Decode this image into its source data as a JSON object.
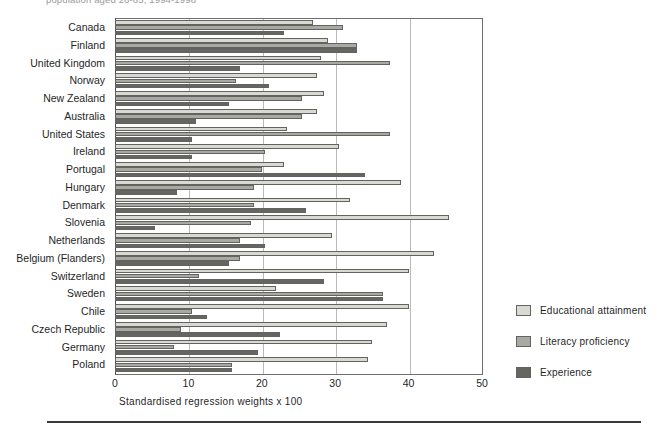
{
  "figure": {
    "title": "population aged 26-65, 1994-1998",
    "bottom_rule": true
  },
  "legend": {
    "position": "right",
    "items": [
      {
        "label": "Educational attainment",
        "color": "#d9d9d4"
      },
      {
        "label": "Literacy proficiency",
        "color": "#a9a9a4"
      },
      {
        "label": "Experience",
        "color": "#656561"
      }
    ]
  },
  "axis": {
    "xlabel": "Standardised regression weights x 100",
    "ticks": [
      "0",
      "10",
      "20",
      "30",
      "40",
      "50"
    ],
    "min": 0,
    "max": 50
  },
  "chart_data": {
    "type": "bar",
    "orientation": "horizontal",
    "title": "population aged 26-65, 1994-1998",
    "xlabel": "Standardised regression weights x 100",
    "ylabel": "",
    "xlim": [
      0,
      50
    ],
    "grid": true,
    "legend_position": "right",
    "categories": [
      "Canada",
      "Finland",
      "United Kingdom",
      "Norway",
      "New Zealand",
      "Australia",
      "United States",
      "Ireland",
      "Portugal",
      "Hungary",
      "Denmark",
      "Slovenia",
      "Netherlands",
      "Belgium (Flanders)",
      "Switzerland",
      "Sweden",
      "Chile",
      "Czech Republic",
      "Germany",
      "Poland"
    ],
    "series": [
      {
        "name": "Educational attainment",
        "color": "#d9d9d4",
        "values": [
          27.0,
          29.0,
          28.0,
          27.5,
          28.5,
          27.5,
          23.5,
          30.5,
          23.0,
          39.0,
          32.0,
          45.5,
          29.5,
          43.5,
          40.0,
          22.0,
          40.0,
          37.0,
          35.0,
          34.5
        ]
      },
      {
        "name": "Literacy proficiency",
        "color": "#a9a9a4",
        "values": [
          31.0,
          33.0,
          37.5,
          16.5,
          25.5,
          25.5,
          37.5,
          20.5,
          20.0,
          19.0,
          19.0,
          18.5,
          17.0,
          17.0,
          11.5,
          36.5,
          10.5,
          9.0,
          8.0,
          16.0
        ]
      },
      {
        "name": "Experience",
        "color": "#656561",
        "values": [
          23.0,
          33.0,
          17.0,
          21.0,
          15.5,
          11.0,
          10.5,
          10.5,
          34.0,
          8.5,
          26.0,
          5.5,
          20.5,
          15.5,
          28.5,
          36.5,
          12.5,
          22.5,
          19.5,
          16.0
        ]
      }
    ]
  }
}
